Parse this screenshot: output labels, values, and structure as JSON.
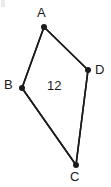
{
  "figure": {
    "type": "geometry-diagram",
    "shape": "quadrilateral",
    "background_color": "#ffffff",
    "stroke_color": "#1a1a1a",
    "stroke_width": 1.6,
    "vertex_marker_radius": 3,
    "width": 111,
    "height": 187,
    "vertices": [
      {
        "id": "A",
        "label": "A",
        "x": 44,
        "y": 27,
        "label_x": 37,
        "label_y": 6
      },
      {
        "id": "B",
        "label": "B",
        "x": 22,
        "y": 88,
        "label_x": 4,
        "label_y": 78
      },
      {
        "id": "C",
        "label": "C",
        "x": 76,
        "y": 165,
        "label_x": 70,
        "label_y": 170
      },
      {
        "id": "D",
        "label": "D",
        "x": 88,
        "y": 70,
        "label_x": 95,
        "label_y": 63
      }
    ],
    "edges": [
      {
        "id": "AB",
        "from": "A",
        "to": "B"
      },
      {
        "id": "BC",
        "from": "B",
        "to": "C"
      },
      {
        "id": "CD",
        "from": "C",
        "to": "D"
      },
      {
        "id": "DA",
        "from": "D",
        "to": "A"
      }
    ],
    "interior_label": {
      "text": "12",
      "x": 55,
      "y": 86
    }
  }
}
